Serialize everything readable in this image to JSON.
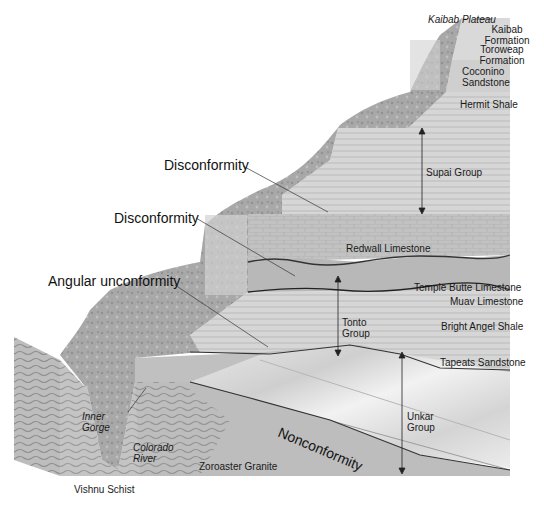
{
  "diagram": {
    "colors": {
      "background": "#ffffff",
      "layer_light": "#dcdcdc",
      "layer_mid": "#c4c4c4",
      "layer_dark": "#a8a8a8",
      "cliff": "#9a9a9a",
      "boundary_line": "#333333"
    },
    "surface_labels": {
      "kaibab_plateau": "Kaibab Plateau"
    },
    "layers": [
      {
        "id": "kaibab",
        "line1": "Kaibab",
        "line2": "Formation"
      },
      {
        "id": "toroweap",
        "line1": "Toroweap",
        "line2": "Formation"
      },
      {
        "id": "coconino",
        "line1": "Coconino",
        "line2": "Sandstone"
      },
      {
        "id": "hermit",
        "label": "Hermit Shale"
      },
      {
        "id": "supai",
        "label": "Supai Group"
      },
      {
        "id": "redwall",
        "label": "Redwall Limestone"
      },
      {
        "id": "temple_butte",
        "label": "Temple Butte Limestone"
      },
      {
        "id": "muav",
        "label": "Muav Limestone"
      },
      {
        "id": "bright_angel",
        "label": "Bright Angel Shale"
      },
      {
        "id": "tapeats",
        "label": "Tapeats Sandstone"
      },
      {
        "id": "zoroaster",
        "label": "Zoroaster Granite"
      },
      {
        "id": "vishnu",
        "label": "Vishnu Schist"
      }
    ],
    "groups": {
      "tonto": {
        "line1": "Tonto",
        "line2": "Group"
      },
      "unkar": {
        "line1": "Unkar",
        "line2": "Group"
      }
    },
    "features": {
      "inner_gorge": {
        "line1": "Inner",
        "line2": "Gorge"
      },
      "colorado_river": {
        "line1": "Colorado",
        "line2": "River"
      }
    },
    "unconformities": {
      "disconformity_upper": "Disconformity",
      "disconformity_lower": "Disconformity",
      "angular": "Angular unconformity",
      "nonconformity": "Nonconformity"
    }
  }
}
